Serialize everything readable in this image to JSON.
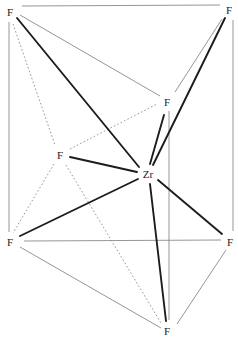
{
  "diagram": {
    "title": "",
    "central_atom": "Zr",
    "atoms": [
      {
        "id": "F1",
        "label": "F",
        "x": 10,
        "y": 12,
        "role": "top-left"
      },
      {
        "id": "F2",
        "label": "F",
        "x": 229,
        "y": 10,
        "role": "top-right"
      },
      {
        "id": "F3",
        "label": "F",
        "x": 167,
        "y": 102,
        "role": "inner-right"
      },
      {
        "id": "F4",
        "label": "F",
        "x": 60,
        "y": 155,
        "role": "inner-left"
      },
      {
        "id": "Zr",
        "label": "Zr",
        "x": 148,
        "y": 174,
        "role": "center"
      },
      {
        "id": "F5",
        "label": "F",
        "x": 10,
        "y": 242,
        "role": "bottom-left"
      },
      {
        "id": "F6",
        "label": "F",
        "x": 230,
        "y": 242,
        "role": "bottom-right"
      },
      {
        "id": "F7",
        "label": "F",
        "x": 167,
        "y": 331,
        "role": "bottom"
      }
    ],
    "bonds": [
      {
        "from": "Zr",
        "to": "F1",
        "x1": 139,
        "y1": 167,
        "x2": 17,
        "y2": 18
      },
      {
        "from": "Zr",
        "to": "F2",
        "x1": 153,
        "y1": 165,
        "x2": 225,
        "y2": 18
      },
      {
        "from": "Zr",
        "to": "F3",
        "x1": 150,
        "y1": 164,
        "x2": 164,
        "y2": 115
      },
      {
        "from": "Zr",
        "to": "F4",
        "x1": 137,
        "y1": 172,
        "x2": 70,
        "y2": 157
      },
      {
        "from": "Zr",
        "to": "F5",
        "x1": 138,
        "y1": 179,
        "x2": 20,
        "y2": 236
      },
      {
        "from": "Zr",
        "to": "F6",
        "x1": 158,
        "y1": 180,
        "x2": 222,
        "y2": 234
      },
      {
        "from": "Zr",
        "to": "F7",
        "x1": 150,
        "y1": 184,
        "x2": 166,
        "y2": 321
      }
    ],
    "solid_edges": [
      {
        "x1": 22,
        "y1": 6,
        "x2": 220,
        "y2": 5
      },
      {
        "x1": 9,
        "y1": 22,
        "x2": 9,
        "y2": 232
      },
      {
        "x1": 233,
        "y1": 20,
        "x2": 233,
        "y2": 231
      },
      {
        "x1": 20,
        "y1": 15,
        "x2": 160,
        "y2": 96
      },
      {
        "x1": 175,
        "y1": 92,
        "x2": 222,
        "y2": 19
      },
      {
        "x1": 169,
        "y1": 111,
        "x2": 169,
        "y2": 320
      },
      {
        "x1": 24,
        "y1": 241,
        "x2": 221,
        "y2": 240
      },
      {
        "x1": 20,
        "y1": 247,
        "x2": 161,
        "y2": 328
      },
      {
        "x1": 177,
        "y1": 324,
        "x2": 226,
        "y2": 250
      }
    ],
    "dotted_edges": [
      {
        "x1": 13,
        "y1": 24,
        "x2": 55,
        "y2": 145
      },
      {
        "x1": 70,
        "y1": 149,
        "x2": 157,
        "y2": 104
      },
      {
        "x1": 54,
        "y1": 164,
        "x2": 13,
        "y2": 233
      },
      {
        "x1": 66,
        "y1": 165,
        "x2": 161,
        "y2": 323
      }
    ]
  }
}
